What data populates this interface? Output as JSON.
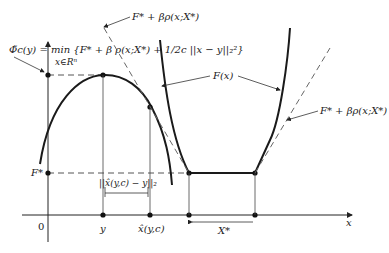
{
  "labels": {
    "phi_def": "Φ̃c(y) = min {F* + β ρ(x;X*) + 1/2c ||x − y||₂²}",
    "phi_def_sub": "x∈Rⁿ",
    "top_bound": "F* + βρ(x;X*)",
    "right_bound": "F* + βρ(x;X*)",
    "F_curve": "F(x)",
    "F_star": "F*",
    "origin": "0",
    "y_tick": "y",
    "xhat_tick": "x̂(y,c)",
    "distance": "||x̂(y,c) − y||₂",
    "X_star": "X*",
    "x_axis": "x"
  },
  "colors": {
    "stroke": "#1a1a1a",
    "dashed": "#555555",
    "thin": "#444444"
  }
}
